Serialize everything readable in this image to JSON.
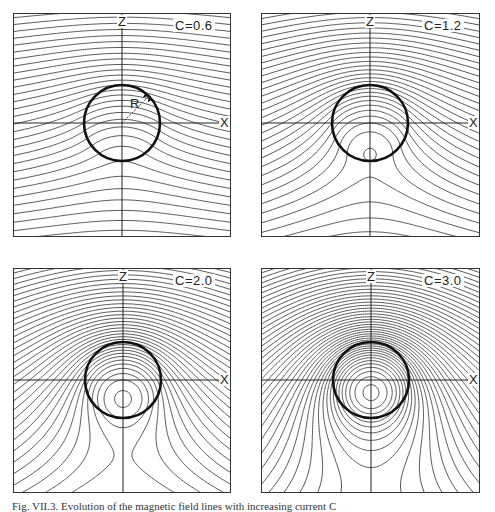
{
  "figure": {
    "caption": "Fig. VII.3. Evolution of the magnetic field lines with increasing current C",
    "colors": {
      "field_line": "#444444",
      "boundary": "#111111",
      "axis": "#222222",
      "frame": "#333333"
    },
    "panels": [
      {
        "id": "p1",
        "parameter_label": "C=0.6",
        "C": 0.6,
        "axis_x_label": "X",
        "axis_z_label": "Z",
        "radius_label": "R",
        "box": {
          "left": 13,
          "top": 13,
          "width": 218,
          "height": 224
        },
        "origin": {
          "x": 109,
          "y": 110
        },
        "radius_px": 38
      },
      {
        "id": "p2",
        "parameter_label": "C=1.2",
        "C": 1.2,
        "axis_x_label": "X",
        "axis_z_label": "Z",
        "box": {
          "left": 261,
          "top": 13,
          "width": 219,
          "height": 224
        },
        "origin": {
          "x": 109,
          "y": 110
        },
        "radius_px": 38
      },
      {
        "id": "p3",
        "parameter_label": "C=2.0",
        "C": 2.0,
        "axis_x_label": "X",
        "axis_z_label": "Z",
        "box": {
          "left": 13,
          "top": 268,
          "width": 218,
          "height": 225
        },
        "origin": {
          "x": 110,
          "y": 112
        },
        "radius_px": 38
      },
      {
        "id": "p4",
        "parameter_label": "C=3.0",
        "C": 3.0,
        "axis_x_label": "X",
        "axis_z_label": "Z",
        "box": {
          "left": 261,
          "top": 268,
          "width": 219,
          "height": 225
        },
        "origin": {
          "x": 110,
          "y": 112
        },
        "radius_px": 38
      }
    ]
  }
}
